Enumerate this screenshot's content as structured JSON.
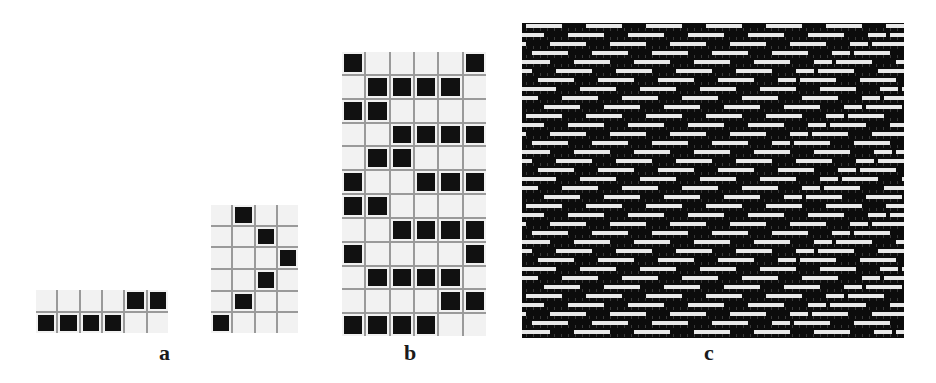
{
  "figure": {
    "panels": [
      {
        "id": "a",
        "label": "a",
        "subfigures": [
          {
            "name": "grid-a1",
            "rows": 2,
            "cols": 6,
            "cells": [
              [
                0,
                0,
                0,
                0,
                1,
                1
              ],
              [
                1,
                1,
                1,
                1,
                0,
                0
              ]
            ]
          },
          {
            "name": "grid-a2",
            "rows": 6,
            "cols": 4,
            "cells": [
              [
                0,
                1,
                0,
                0
              ],
              [
                0,
                0,
                1,
                0
              ],
              [
                0,
                0,
                0,
                1
              ],
              [
                0,
                0,
                1,
                0
              ],
              [
                0,
                1,
                0,
                0
              ],
              [
                1,
                0,
                0,
                0
              ]
            ]
          }
        ]
      },
      {
        "id": "b",
        "label": "b",
        "rows": 12,
        "cols": 6,
        "cells": [
          [
            1,
            0,
            0,
            0,
            0,
            1
          ],
          [
            0,
            1,
            1,
            1,
            1,
            0
          ],
          [
            1,
            1,
            0,
            0,
            0,
            0
          ],
          [
            0,
            0,
            1,
            1,
            1,
            1
          ],
          [
            0,
            1,
            1,
            0,
            0,
            0
          ],
          [
            1,
            0,
            0,
            1,
            1,
            1
          ],
          [
            1,
            1,
            0,
            0,
            0,
            0
          ],
          [
            0,
            0,
            1,
            1,
            1,
            1
          ],
          [
            1,
            0,
            0,
            0,
            0,
            1
          ],
          [
            0,
            1,
            1,
            1,
            1,
            0
          ],
          [
            0,
            0,
            0,
            0,
            1,
            1
          ],
          [
            1,
            1,
            1,
            1,
            0,
            0
          ]
        ]
      },
      {
        "id": "c",
        "label": "c",
        "description": "simulated woven fabric texture: white weft floats on black ground",
        "colors": {
          "ground": "#0c0c0c",
          "float": "#e8e8e8"
        }
      }
    ]
  }
}
